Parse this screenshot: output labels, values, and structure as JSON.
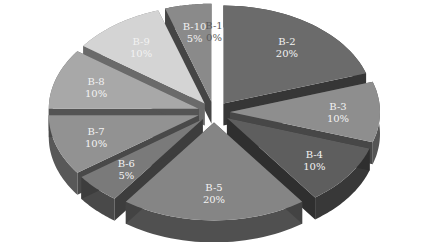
{
  "chart_data": {
    "type": "pie",
    "style": "3d-exploded",
    "title": "",
    "categories": [
      "B-1",
      "B-2",
      "B-3",
      "B-4",
      "B-5",
      "B-6",
      "B-7",
      "B-8",
      "B-9",
      "B-10"
    ],
    "values": [
      0,
      20,
      10,
      10,
      20,
      5,
      10,
      10,
      10,
      5
    ],
    "labels": [
      "0%",
      "20%",
      "10%",
      "10%",
      "20%",
      "5%",
      "10%",
      "10%",
      "10%",
      "5%"
    ],
    "colors": {
      "B-1": "#ffffff",
      "B-2": "#6b6b6b",
      "B-3": "#8e8e8e",
      "B-4": "#5e5e5e",
      "B-5": "#858585",
      "B-6": "#7a7a7a",
      "B-7": "#929292",
      "B-8": "#a8a8a8",
      "B-9": "#d4d4d4",
      "B-10": "#8a8a8a"
    },
    "legend": "none",
    "start_angle": "top",
    "direction": "clockwise"
  }
}
